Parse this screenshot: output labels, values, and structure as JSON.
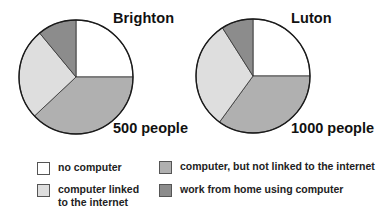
{
  "chart_data": [
    {
      "type": "pie",
      "title": "Brighton",
      "subtitle": "500 people",
      "categories": [
        "no computer",
        "computer, but not linked to the internet",
        "computer linked to the internet",
        "work from home using computer"
      ],
      "values": [
        25,
        38,
        26,
        11
      ],
      "unit": "%",
      "start_angle_deg": 0,
      "direction": "clockwise"
    },
    {
      "type": "pie",
      "title": "Luton",
      "subtitle": "1000 people",
      "categories": [
        "no computer",
        "computer, but not linked to the internet",
        "computer linked to the internet",
        "work from home using computer"
      ],
      "values": [
        25,
        35,
        31,
        9
      ],
      "unit": "%",
      "start_angle_deg": 0,
      "direction": "clockwise"
    }
  ],
  "charts": [
    {
      "title": "Brighton",
      "count": "500 people"
    },
    {
      "title": "Luton",
      "count": "1000 people"
    }
  ],
  "legend": {
    "position": "bottom",
    "items": [
      {
        "label": "no computer",
        "color": "#ffffff"
      },
      {
        "label": "computer linked to the internet",
        "line1": "computer linked",
        "line2": "to the internet",
        "color": "#dedede"
      },
      {
        "label": "computer, but not linked to the internet",
        "color": "#b0b0b0"
      },
      {
        "label": "work from home using computer",
        "color": "#8c8c8c"
      }
    ]
  },
  "colors": {
    "no_computer": "#ffffff",
    "not_linked": "#b0b0b0",
    "linked": "#dedede",
    "work_from_home": "#8c8c8c",
    "outline": "#1a1a1a"
  }
}
